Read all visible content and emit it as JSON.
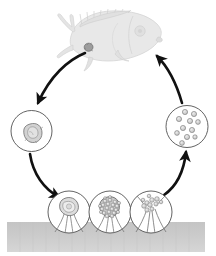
{
  "figure": {
    "name": "parasite-life-cycle-diagram",
    "type": "biological-life-cycle",
    "caption_fragment": "",
    "background_color": "#ffffff",
    "line_color": "#1a1a1a",
    "circle_stroke_color": "#3a3a3a",
    "substrate_color": "#c9c9c9",
    "fish_fill_color": "#e6e6e6",
    "fish_stroke_color": "#d2d2d2",
    "cell_fill_color": "#cfcfcf",
    "cell_stroke_color": "#6e6e6e"
  },
  "host": {
    "label": "fish-host",
    "description": "fish silhouette, head to the right, tail to the left",
    "infection_site_label": "trophont-on-fish"
  },
  "substrate": {
    "label": "substrate-bottom",
    "x": 7,
    "y": 222,
    "width": 198,
    "height": 30
  },
  "stages": [
    {
      "id": "stage-encysted",
      "label": "encysted-stage",
      "description": "single rounded organism enclosed in circle",
      "cx": 31.5,
      "cy": 131,
      "r": 20.5,
      "inner_cells": 1
    },
    {
      "id": "stage-attached-tomont",
      "label": "attached-tomont",
      "description": "stalked cyst attached to substrate containing one organism",
      "cx": 69,
      "cy": 212,
      "r": 21,
      "inner_cells": 1
    },
    {
      "id": "stage-dividing-tomont",
      "label": "dividing-tomont",
      "description": "stalked cyst filled with many dividing daughter cells",
      "cx": 110,
      "cy": 212,
      "r": 21,
      "inner_cells": 22
    },
    {
      "id": "stage-released-tomites",
      "label": "released-tomites",
      "description": "ruptured cyst releasing daughter cells from the stalk",
      "cx": 151,
      "cy": 212,
      "r": 21,
      "inner_cells": 11
    },
    {
      "id": "stage-free-swimming-theronts",
      "label": "free-swimming-theronts",
      "description": "circle containing many free-swimming infective cells",
      "cx": 187,
      "cy": 126.5,
      "r": 21,
      "inner_cells": 11
    }
  ],
  "arrows": [
    {
      "id": "arrow-fish-to-encysted",
      "label": "arrow-host-to-encysted-stage",
      "from": "host",
      "to": "stage-encysted",
      "direction": "down-left",
      "style": "curved-thick"
    },
    {
      "id": "arrow-encysted-to-attached",
      "label": "arrow-encysted-to-attached-tomont",
      "from": "stage-encysted",
      "to": "stage-attached-tomont",
      "direction": "down-right",
      "style": "curved-thick"
    },
    {
      "id": "arrow-attached-to-dividing",
      "label": "arrow-attached-to-dividing-tomont",
      "from": "stage-attached-tomont",
      "to": "stage-dividing-tomont",
      "direction": "right",
      "style": "short-straight"
    },
    {
      "id": "arrow-dividing-to-released",
      "label": "arrow-dividing-to-released-tomites",
      "from": "stage-dividing-tomont",
      "to": "stage-released-tomites",
      "direction": "right",
      "style": "short-straight"
    },
    {
      "id": "arrow-released-to-theronts",
      "label": "arrow-released-to-free-swimming-theronts",
      "from": "stage-released-tomites",
      "to": "stage-free-swimming-theronts",
      "direction": "up-right",
      "style": "curved-thick"
    },
    {
      "id": "arrow-theronts-to-fish",
      "label": "arrow-theronts-to-host",
      "from": "stage-free-swimming-theronts",
      "to": "host",
      "direction": "up-left",
      "style": "curved-thick"
    }
  ]
}
